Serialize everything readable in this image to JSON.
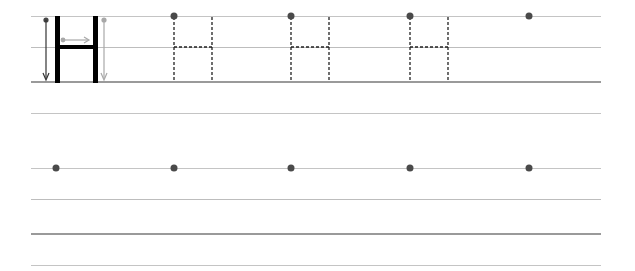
{
  "worksheet": {
    "letter": "H",
    "colors": {
      "guide_line": "#c4c4c4",
      "baseline": "#9a9a9a",
      "model_stroke": "#000000",
      "dot": "#4a4a4a",
      "arrow_dark": "#333333",
      "arrow_light": "#a8a8a8",
      "trace_dash": "#222222"
    },
    "rows": [
      {
        "lines_y": [
          16,
          47,
          82,
          113
        ],
        "model_letter": {
          "left_x": 57,
          "right_x": 96,
          "top_y": 16,
          "bottom_y": 82,
          "crossbar_y": 47
        },
        "trace_letters": [
          {
            "left_x": 174,
            "right_x": 212
          },
          {
            "left_x": 291,
            "right_x": 329
          },
          {
            "left_x": 410,
            "right_x": 448
          }
        ],
        "start_dots_x": [
          174,
          291,
          410,
          529
        ]
      },
      {
        "lines_y": [
          168,
          199,
          234,
          265
        ],
        "start_dots_x": [
          56,
          174,
          291,
          410,
          529
        ]
      }
    ]
  }
}
